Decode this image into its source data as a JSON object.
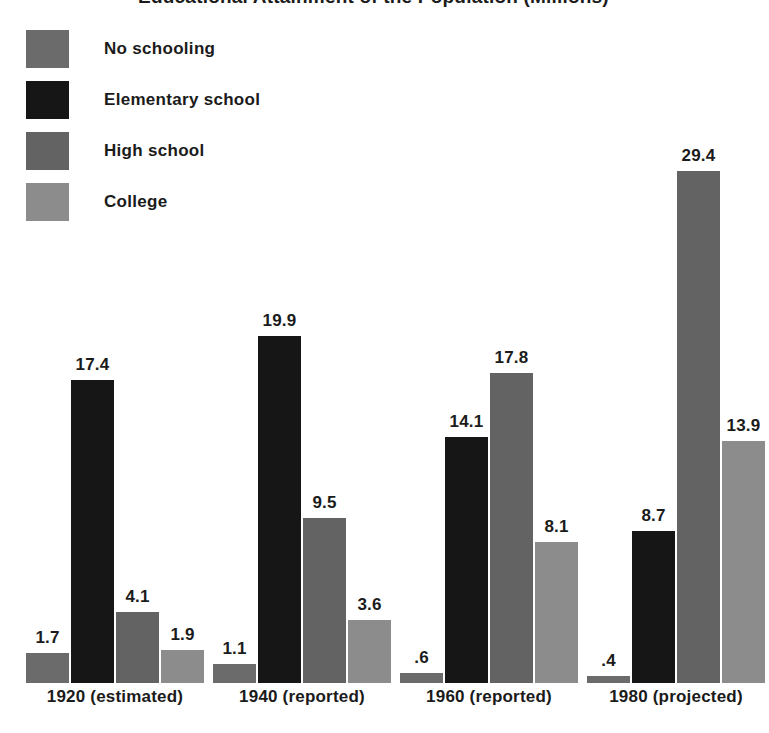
{
  "chart_data": {
    "type": "bar",
    "title": "Educational Attainment of the Population (Millions)",
    "xlabel": "",
    "ylabel": "",
    "ylim": [
      0,
      29.4
    ],
    "grid": false,
    "legend_position": "top-left",
    "categories": [
      "1920 (estimated)",
      "1940 (reported)",
      "1960 (reported)",
      "1980 (projected)"
    ],
    "series": [
      {
        "name": "No schooling",
        "color": "#6b6b6b",
        "values": [
          1.7,
          1.1,
          0.6,
          0.4
        ],
        "labels": [
          "1.7",
          "1.1",
          ".6",
          ".4"
        ]
      },
      {
        "name": "Elementary school",
        "color": "#161616",
        "values": [
          17.4,
          19.9,
          14.1,
          8.7
        ],
        "labels": [
          "17.4",
          "19.9",
          "14.1",
          "8.7"
        ]
      },
      {
        "name": "High school",
        "color": "#636363",
        "values": [
          4.1,
          9.5,
          17.8,
          29.4
        ],
        "labels": [
          "4.1",
          "9.5",
          "17.8",
          "29.4"
        ]
      },
      {
        "name": "College",
        "color": "#8c8c8c",
        "values": [
          1.9,
          3.6,
          8.1,
          13.9
        ],
        "labels": [
          "1.9",
          "3.6",
          "8.1",
          "13.9"
        ]
      }
    ]
  },
  "legend": {
    "items": [
      {
        "label": "No schooling",
        "color": "#6b6b6b",
        "swatch_name": "legend-swatch-no-schooling"
      },
      {
        "label": "Elementary school",
        "color": "#161616",
        "swatch_name": "legend-swatch-elementary-school"
      },
      {
        "label": "High school",
        "color": "#636363",
        "swatch_name": "legend-swatch-high-school"
      },
      {
        "label": "College",
        "color": "#8c8c8c",
        "swatch_name": "legend-swatch-college"
      }
    ]
  },
  "layout": {
    "bar_width": 43,
    "bar_gap": 2,
    "group_gap": 9,
    "first_bar_x": 26,
    "baseline_y": 683,
    "px_per_unit": 17.42
  }
}
